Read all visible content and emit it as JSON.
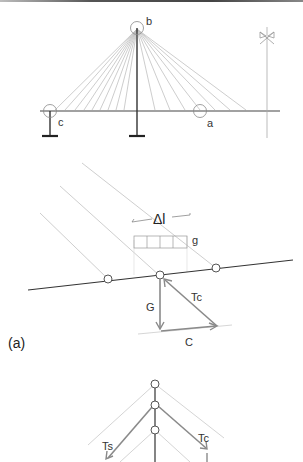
{
  "figure": {
    "panel_label": "(a)",
    "colors": {
      "deck": "#333333",
      "cable": "#b5b5b5",
      "force": "#8a8a8a",
      "node": "#555555"
    }
  },
  "top_bridge": {
    "labels": {
      "pylon_top": "b",
      "left_support": "c",
      "midspan": "a"
    },
    "symbol": "symmetry-axis"
  },
  "detail": {
    "labels": {
      "segment_length": "Δl",
      "dead_load": "g",
      "weight": "G",
      "cable_force": "Tc",
      "compression": "C"
    }
  },
  "pylon_detail": {
    "labels": {
      "backstay_force": "Ts",
      "cable_force": "Tc"
    }
  }
}
